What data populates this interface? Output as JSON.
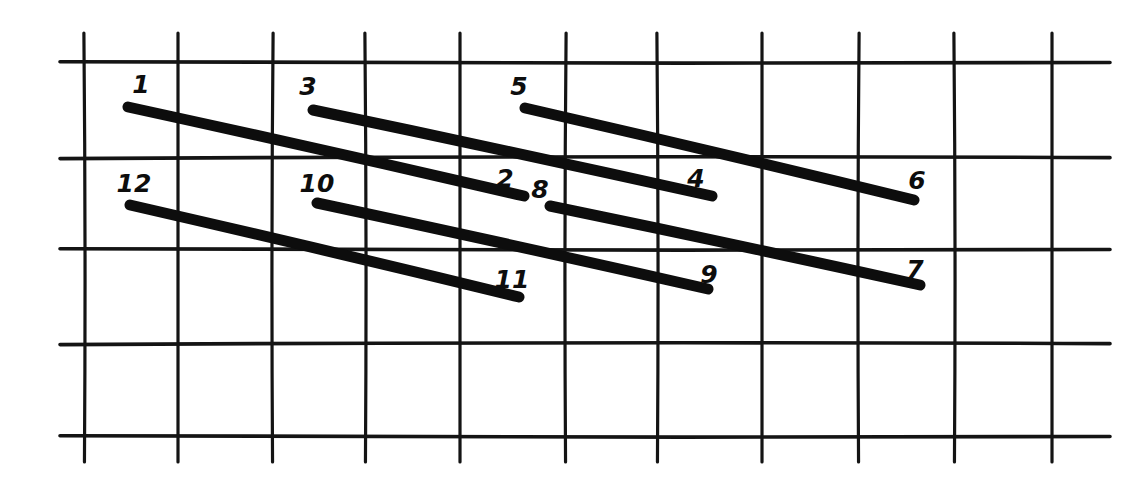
{
  "figure": {
    "background_color": "#ffffff",
    "ink_color": "#0d0d0d",
    "grid_color": "#141414",
    "width": 1131,
    "height": 497
  },
  "chart_data": {
    "type": "diagram",
    "xlabel": "",
    "ylabel": "",
    "grid": true,
    "legend": null,
    "grid_lines": {
      "vertical_x": [
        85,
        178,
        272,
        366,
        460,
        565,
        658,
        762,
        858,
        955,
        1052
      ],
      "vertical_y_top": 33,
      "vertical_y_bottom": 462,
      "horizontal_y": [
        63,
        157,
        250,
        343,
        437
      ],
      "horizontal_x_left": 60,
      "horizontal_x_right": 1110
    },
    "segments": [
      {
        "id": 1,
        "start_label": "1",
        "end_label": "2",
        "x1": 128,
        "y1": 107,
        "x2": 524,
        "y2": 196,
        "start_label_x": 141,
        "start_label_y": 93,
        "end_label_x": 505,
        "end_label_y": 187
      },
      {
        "id": 2,
        "start_label": "3",
        "end_label": "4",
        "x1": 313,
        "y1": 110,
        "x2": 712,
        "y2": 196,
        "start_label_x": 308,
        "start_label_y": 95,
        "end_label_x": 696,
        "end_label_y": 187
      },
      {
        "id": 3,
        "start_label": "5",
        "end_label": "6",
        "x1": 525,
        "y1": 108,
        "x2": 914,
        "y2": 200,
        "start_label_x": 519,
        "start_label_y": 95,
        "end_label_x": 917,
        "end_label_y": 189
      },
      {
        "id": 4,
        "start_label": "12",
        "end_label": "11",
        "x1": 130,
        "y1": 205,
        "x2": 519,
        "y2": 297,
        "start_label_x": 134,
        "start_label_y": 192,
        "end_label_x": 512,
        "end_label_y": 288
      },
      {
        "id": 5,
        "start_label": "10",
        "end_label": "9",
        "x1": 317,
        "y1": 203,
        "x2": 708,
        "y2": 289,
        "start_label_x": 317,
        "start_label_y": 192,
        "end_label_x": 709,
        "end_label_y": 283
      },
      {
        "id": 6,
        "start_label": "8",
        "end_label": "7",
        "x1": 550,
        "y1": 206,
        "x2": 920,
        "y2": 285,
        "start_label_x": 540,
        "start_label_y": 198,
        "end_label_x": 915,
        "end_label_y": 278
      }
    ],
    "labels": [
      "1",
      "2",
      "3",
      "4",
      "5",
      "6",
      "7",
      "8",
      "9",
      "10",
      "11",
      "12"
    ]
  }
}
